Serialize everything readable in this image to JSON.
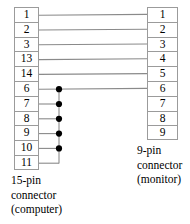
{
  "diagram": {
    "title_alt": "VGA 15-pin to 9-pin connector pinout wiring diagram",
    "colors": {
      "box_border": "#9b9b9b",
      "wire": "#8a8a8a",
      "junction_dot": "#000000",
      "text": "#000000",
      "background": "#ffffff"
    },
    "left_connector": {
      "id": "left-connector",
      "label_lines": [
        "15-pin",
        "connector",
        "(computer)"
      ],
      "pin_count_label": "15-pin",
      "device": "computer",
      "pins": [
        {
          "label": "1"
        },
        {
          "label": "2"
        },
        {
          "label": "3"
        },
        {
          "label": "13"
        },
        {
          "label": "14"
        },
        {
          "label": "6"
        },
        {
          "label": "7"
        },
        {
          "label": "8"
        },
        {
          "label": "9"
        },
        {
          "label": "10"
        },
        {
          "label": "11"
        }
      ]
    },
    "right_connector": {
      "id": "right-connector",
      "label_lines": [
        "9-pin",
        "connector",
        "(monitor)"
      ],
      "pin_count_label": "9-pin",
      "device": "monitor",
      "pins": [
        {
          "label": "1"
        },
        {
          "label": "2"
        },
        {
          "label": "3"
        },
        {
          "label": "4"
        },
        {
          "label": "5"
        },
        {
          "label": "6"
        },
        {
          "label": "7"
        },
        {
          "label": "8"
        },
        {
          "label": "9"
        }
      ]
    },
    "connections": [
      {
        "from": "1",
        "to": "1"
      },
      {
        "from": "2",
        "to": "2"
      },
      {
        "from": "3",
        "to": "3"
      },
      {
        "from": "13",
        "to": "4"
      },
      {
        "from": "14",
        "to": "5"
      },
      {
        "from": "6",
        "to": "6"
      }
    ],
    "ground_bus": {
      "description": "common bus tying left pins 6,7,8,9,10,11 together and out to right pin 6",
      "member_pins": [
        "6",
        "7",
        "8",
        "9",
        "10",
        "11"
      ],
      "junction_pins": [
        "6",
        "7",
        "8",
        "9",
        "10"
      ],
      "junction_count": 5
    },
    "unconnected_right_pins": [
      "7",
      "8",
      "9"
    ]
  }
}
